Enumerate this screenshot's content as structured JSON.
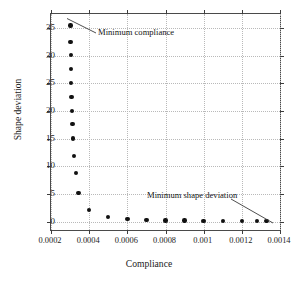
{
  "chart_data": {
    "type": "scatter",
    "title": "",
    "xlabel": "Compliance",
    "ylabel": "Shape deviation",
    "xlim": [
      0.0002,
      0.0014
    ],
    "ylim": [
      -1.5,
      37.5
    ],
    "xticks": [
      0.0002,
      0.0004,
      0.0006,
      0.0008,
      0.001,
      0.0012,
      0.0014
    ],
    "xticklabels": [
      "0.0002",
      "0.0004",
      "0.0006",
      "0.0008",
      "0.001",
      "0.0012",
      "0.0014"
    ],
    "yticks": [
      0,
      5,
      10,
      15,
      20,
      25,
      30,
      35
    ],
    "yticklabels": [
      "0",
      "5",
      "10",
      "15",
      "20",
      "25",
      "30",
      "35"
    ],
    "grid": true,
    "legend": null,
    "marker": "filled-circle",
    "marker_color": "#111111",
    "series": [
      {
        "name": "Pareto front",
        "x": [
          0.000303,
          0.000303,
          0.000304,
          0.000305,
          0.000306,
          0.000308,
          0.00031,
          0.000312,
          0.000315,
          0.00032,
          0.00033,
          0.000345,
          0.0004,
          0.0005,
          0.0006,
          0.0007,
          0.0008,
          0.0009,
          0.001,
          0.0011,
          0.0012,
          0.00128,
          0.00133
        ],
        "y": [
          35.4,
          32.5,
          30.1,
          27.6,
          25.0,
          22.5,
          20.0,
          17.6,
          15.0,
          11.9,
          8.8,
          5.2,
          2.1,
          0.8,
          0.5,
          0.35,
          0.25,
          0.2,
          0.15,
          0.12,
          0.1,
          0.1,
          0.1
        ]
      }
    ],
    "annotations": [
      {
        "id": "minimum-compliance",
        "text": "Minimum compliance",
        "point_x": 0.000303,
        "point_y": 35.4
      },
      {
        "id": "minimum-shape-deviation",
        "text": "Minimum shape deviation",
        "point_x": 0.00133,
        "point_y": 0.1
      }
    ]
  }
}
